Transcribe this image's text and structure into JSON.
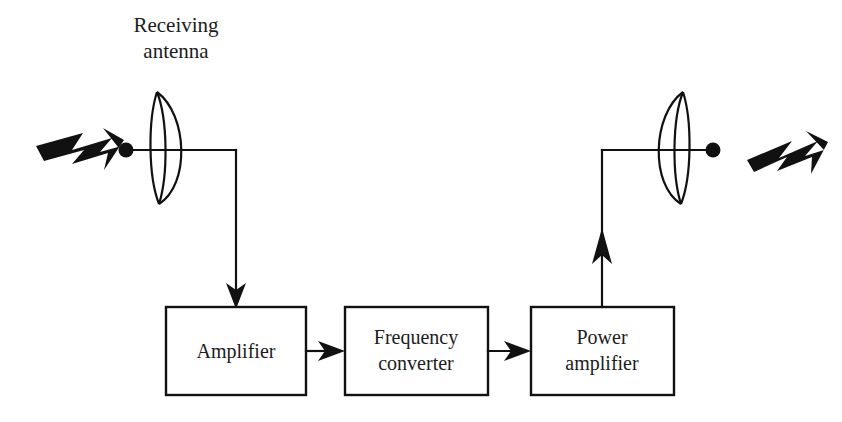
{
  "diagram": {
    "type": "block-diagram",
    "background_color": "#ffffff",
    "line_color": "#111111",
    "text_color": "#1c1c1c",
    "labels": {
      "receiving_antenna": {
        "line1": "Receiving",
        "line2": "antenna"
      },
      "transmitting_antenna": {
        "line1": "Transmitting",
        "line2": "antenna"
      }
    },
    "blocks": [
      {
        "id": "amplifier",
        "line1": "Amplifier",
        "line2": ""
      },
      {
        "id": "frequency-converter",
        "line1": "Frequency",
        "line2": "converter"
      },
      {
        "id": "power-amplifier",
        "line1": "Power",
        "line2": "amplifier"
      }
    ],
    "signals": [
      {
        "id": "incoming-wave",
        "direction": "right",
        "description": "incoming radio wave"
      },
      {
        "id": "outgoing-wave",
        "direction": "up-right",
        "description": "outgoing radio wave"
      }
    ],
    "connections": [
      {
        "from": "receiving-antenna",
        "to": "amplifier"
      },
      {
        "from": "amplifier",
        "to": "frequency-converter"
      },
      {
        "from": "frequency-converter",
        "to": "power-amplifier"
      },
      {
        "from": "power-amplifier",
        "to": "transmitting-antenna"
      }
    ]
  }
}
